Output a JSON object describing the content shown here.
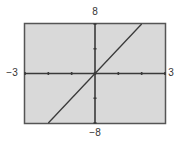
{
  "chart_data": {
    "type": "line",
    "title": "",
    "xlabel": "",
    "ylabel": "",
    "xlim": [
      -3,
      3
    ],
    "ylim": [
      -8,
      8
    ],
    "x_tick_step": 1,
    "y_tick_step": 4,
    "grid": false,
    "legend": null,
    "series": [
      {
        "name": "y = 4x",
        "x": [
          -2,
          2
        ],
        "y": [
          -8,
          8
        ]
      }
    ],
    "window_labels": {
      "xmin": "−3",
      "xmax": "3",
      "ymin": "−8",
      "ymax": "8"
    },
    "colors": {
      "background": "#d9d9d9",
      "frame": "#555555",
      "axis": "#3a3a3a",
      "line": "#3a3a3a"
    }
  }
}
